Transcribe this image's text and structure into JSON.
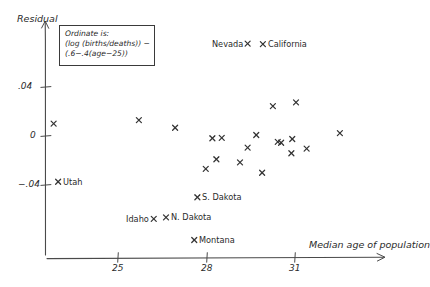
{
  "title": {
    "text": "RESULTS",
    "clipped": true
  },
  "annotation": {
    "line1": "Ordinate is:",
    "line2": "(log (births/deaths)) −",
    "line3": "(.6−.4(age−25))"
  },
  "axes": {
    "y_label": "Residual",
    "x_label": "Median age of population",
    "y_ticks": [
      {
        "label": ".04",
        "value": 0.04,
        "y": 87
      },
      {
        "label": "0",
        "value": 0,
        "y": 136
      },
      {
        "label": "−.04",
        "value": -0.04,
        "y": 185
      }
    ],
    "x_ticks": [
      {
        "label": "25",
        "value": 25,
        "x": 118
      },
      {
        "label": "28",
        "value": 28,
        "x": 207
      },
      {
        "label": "31",
        "value": 31,
        "x": 295
      }
    ]
  },
  "colors": {
    "ink": "#2b2b2b",
    "axis": "#4a4a4a",
    "background": "#ffffff"
  },
  "chart_data": {
    "type": "scatter",
    "xlabel": "Median age of population",
    "ylabel": "Residual",
    "xlim": [
      23.0,
      34.5
    ],
    "ylim": [
      -0.075,
      0.065
    ],
    "grid": false,
    "legend": null,
    "annotations": [
      "Ordinate is: (log (births/deaths)) − (.6−.4(age−25))"
    ],
    "marker": "x",
    "points": [
      {
        "label": "Nevada",
        "x": 24.7,
        "y": 0.0755,
        "px": 248,
        "py": 44,
        "label_side": "left"
      },
      {
        "label": "California",
        "x": 25.2,
        "y": 0.0755,
        "px": 263,
        "py": 44,
        "label_side": "right"
      },
      {
        "label": "Utah",
        "x": 23.3,
        "y": -0.0377,
        "px": 58,
        "py": 182,
        "label_side": "right"
      },
      {
        "label": "S. Dakota",
        "x": 26.0,
        "y": -0.0418,
        "px": 197,
        "py": 197,
        "label_side": "right"
      },
      {
        "label": "Idaho",
        "x": 25.3,
        "y": -0.0561,
        "px": 154,
        "py": 219,
        "label_side": "left"
      },
      {
        "label": "N. Dakota",
        "x": 25.9,
        "y": -0.0561,
        "px": 166,
        "py": 217,
        "label_side": "right"
      },
      {
        "label": "Montana",
        "x": 26.6,
        "y": -0.0704,
        "px": 194,
        "py": 240,
        "label_side": "right"
      },
      {
        "label": null,
        "x": 23.2,
        "y": 0.0098,
        "px": 54,
        "py": 124
      },
      {
        "label": null,
        "x": 26.6,
        "y": 0.0139,
        "px": 139,
        "py": 120
      },
      {
        "label": null,
        "x": 28.0,
        "y": 0.0057,
        "px": 175,
        "py": 128
      },
      {
        "label": null,
        "x": 28.9,
        "y": -0.0016,
        "px": 212,
        "py": 138
      },
      {
        "label": null,
        "x": 29.2,
        "y": -0.0016,
        "px": 222,
        "py": 138
      },
      {
        "label": null,
        "x": 29.8,
        "y": -0.0212,
        "px": 240,
        "py": 162
      },
      {
        "label": null,
        "x": 30.3,
        "y": 0.0008,
        "px": 256,
        "py": 135
      },
      {
        "label": null,
        "x": 30.0,
        "y": -0.0098,
        "px": 248,
        "py": 148
      },
      {
        "label": null,
        "x": 30.9,
        "y": 0.0245,
        "px": 273,
        "py": 106
      },
      {
        "label": null,
        "x": 31.2,
        "y": -0.0057,
        "px": 281,
        "py": 143
      },
      {
        "label": null,
        "x": 31.5,
        "y": -0.0139,
        "px": 291,
        "py": 153
      },
      {
        "label": null,
        "x": 31.1,
        "y": -0.0049,
        "px": 278,
        "py": 142
      },
      {
        "label": null,
        "x": 32.0,
        "y": 0.0286,
        "px": 296,
        "py": 102
      },
      {
        "label": null,
        "x": 31.8,
        "y": -0.0024,
        "px": 292,
        "py": 139
      },
      {
        "label": null,
        "x": 32.5,
        "y": -0.0106,
        "px": 307,
        "py": 149
      },
      {
        "label": null,
        "x": 33.5,
        "y": 0.0024,
        "px": 340,
        "py": 133
      },
      {
        "label": null,
        "x": 30.5,
        "y": -0.0302,
        "px": 262,
        "py": 173
      },
      {
        "label": null,
        "x": 29.0,
        "y": -0.0184,
        "px": 216,
        "py": 159
      },
      {
        "label": null,
        "x": 28.3,
        "y": -0.0269,
        "px": 206,
        "py": 169
      }
    ]
  }
}
